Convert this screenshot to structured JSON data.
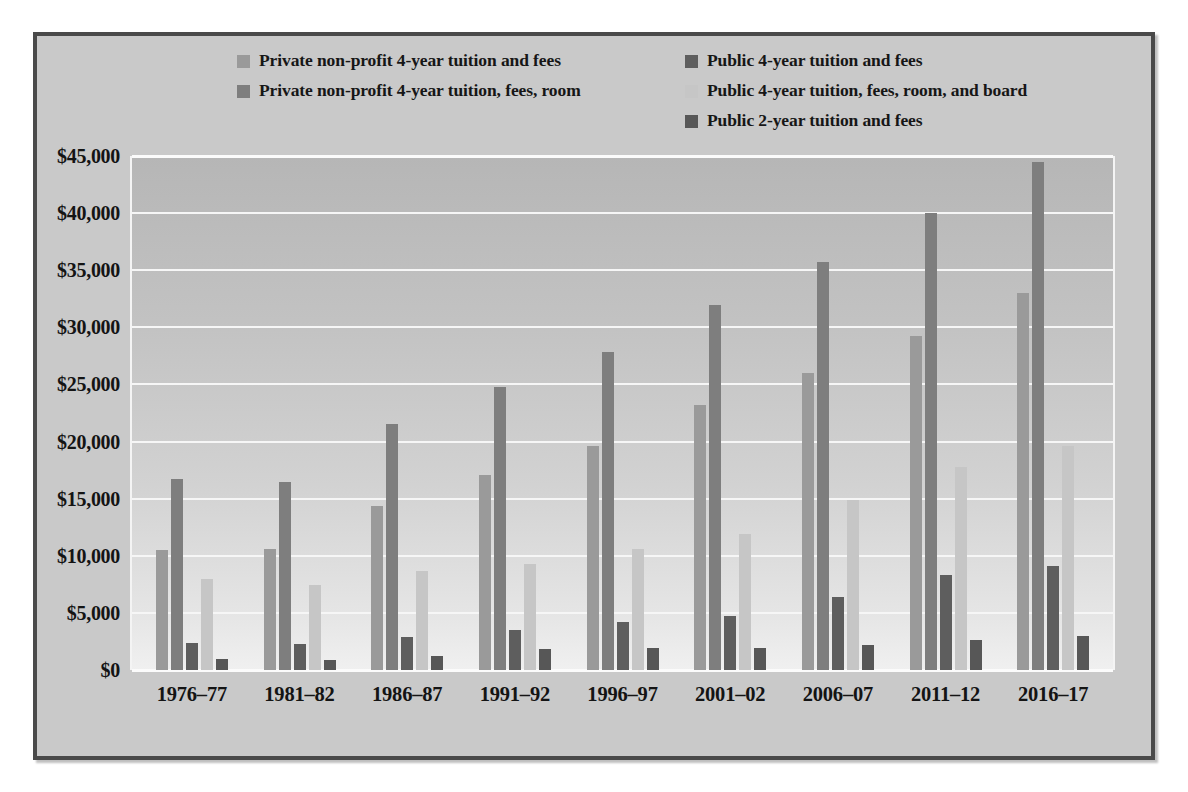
{
  "chart_data": {
    "type": "bar",
    "title": "",
    "subtitle": "",
    "xlabel": "",
    "ylabel": "",
    "ylim": [
      0,
      45000
    ],
    "ytick_step": 5000,
    "ytick_labels": [
      "$45,000",
      "$40,000",
      "$35,000",
      "$30,000",
      "$25,000",
      "$20,000",
      "$15,000",
      "$10,000",
      "$5,000",
      "$0"
    ],
    "ytick_values": [
      45000,
      40000,
      35000,
      30000,
      25000,
      20000,
      15000,
      10000,
      5000,
      0
    ],
    "grid": true,
    "legend_position": "top",
    "categories": [
      "1976–77",
      "1981–82",
      "1986–87",
      "1991–92",
      "1996–97",
      "2001–02",
      "2006–07",
      "2011–12",
      "2016–17"
    ],
    "series": [
      {
        "name": "Private non-profit 4-year tuition and fees",
        "color": "#9a9a9a",
        "values": [
          10500,
          10600,
          14400,
          17100,
          19600,
          23200,
          26000,
          29200,
          33000
        ]
      },
      {
        "name": "Private non-profit 4-year tuition, fees, room",
        "color": "#7e7e7e",
        "values": [
          16700,
          16500,
          21500,
          24800,
          27800,
          32000,
          35700,
          40000,
          44500
        ]
      },
      {
        "name": "Public 4-year tuition and fees",
        "color": "#5e5e5e",
        "values": [
          2400,
          2300,
          2900,
          3500,
          4200,
          4700,
          6400,
          8300,
          9100
        ]
      },
      {
        "name": "Public 4-year tuition, fees, room, and board",
        "color": "#c6c6c6",
        "values": [
          8000,
          7400,
          8700,
          9300,
          10600,
          11900,
          14900,
          17800,
          19600
        ]
      },
      {
        "name": "Public 2-year tuition and fees",
        "color": "#575757",
        "values": [
          1000,
          900,
          1200,
          1800,
          1950,
          1900,
          2200,
          2600,
          3000
        ]
      }
    ]
  },
  "legend": {
    "left_column": [
      {
        "label": "Private non-profit 4-year tuition and fees",
        "color": "#9a9a9a",
        "series_index": 0
      },
      {
        "label": "Private non-profit 4-year tuition, fees, room",
        "color": "#7e7e7e",
        "series_index": 1
      }
    ],
    "right_column": [
      {
        "label": "Public 4-year tuition and fees",
        "color": "#5e5e5e",
        "series_index": 2
      },
      {
        "label": "Public 4-year tuition, fees, room, and board",
        "color": "#c6c6c6",
        "series_index": 3
      },
      {
        "label": "Public 2-year tuition and fees",
        "color": "#575757",
        "series_index": 4
      }
    ]
  },
  "colors": {
    "figure_background": "#c9c9c9",
    "figure_border": "#4a4a4a",
    "gridline": "#f6f6f6",
    "text": "#141414"
  }
}
